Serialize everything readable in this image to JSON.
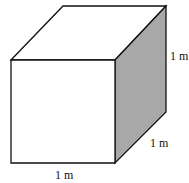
{
  "figure": {
    "type": "cube",
    "labels": {
      "height": "1 m",
      "depth": "1 m",
      "width": "1 m"
    },
    "colors": {
      "outline": "#111111",
      "front_face": "#ffffff",
      "top_face": "#ffffff",
      "side_face": "#a8a8a8"
    }
  }
}
